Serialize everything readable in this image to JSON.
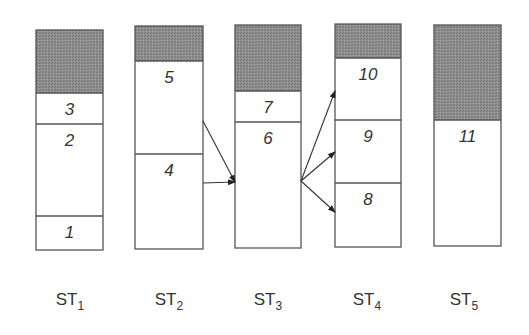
{
  "diagram": {
    "type": "segmented-stacks-with-transfer-arrows",
    "colors": {
      "shaded": "#8a8a8a",
      "outline": "#555555",
      "text": "#333333",
      "background": "#ffffff"
    },
    "stacks": [
      {
        "id": "ST1",
        "label_main": "ST",
        "label_sub": "1",
        "x": 36,
        "width": 67,
        "top": 30,
        "bottom": 250,
        "label_x": 70,
        "segments": [
          {
            "kind": "shaded",
            "top": 30,
            "bottom": 93
          },
          {
            "kind": "block",
            "label": "3",
            "top": 93,
            "bottom": 124
          },
          {
            "kind": "block",
            "label": "2",
            "top": 124,
            "bottom": 216
          },
          {
            "kind": "block",
            "label": "1",
            "top": 216,
            "bottom": 250
          }
        ]
      },
      {
        "id": "ST2",
        "label_main": "ST",
        "label_sub": "2",
        "x": 135,
        "width": 68,
        "top": 26,
        "bottom": 249,
        "label_x": 169,
        "segments": [
          {
            "kind": "shaded",
            "top": 26,
            "bottom": 61
          },
          {
            "kind": "block",
            "label": "5",
            "top": 61,
            "bottom": 154
          },
          {
            "kind": "block",
            "label": "4",
            "top": 154,
            "bottom": 249
          }
        ]
      },
      {
        "id": "ST3",
        "label_main": "ST",
        "label_sub": "3",
        "x": 235,
        "width": 66,
        "top": 25,
        "bottom": 248,
        "label_x": 268,
        "segments": [
          {
            "kind": "shaded",
            "top": 25,
            "bottom": 91
          },
          {
            "kind": "block",
            "label": "7",
            "top": 91,
            "bottom": 122
          },
          {
            "kind": "block",
            "label": "6",
            "top": 122,
            "bottom": 248
          }
        ]
      },
      {
        "id": "ST4",
        "label_main": "ST",
        "label_sub": "4",
        "x": 335,
        "width": 66,
        "top": 24,
        "bottom": 247,
        "label_x": 367,
        "segments": [
          {
            "kind": "shaded",
            "top": 24,
            "bottom": 58
          },
          {
            "kind": "block",
            "label": "10",
            "top": 58,
            "bottom": 120
          },
          {
            "kind": "block",
            "label": "9",
            "top": 120,
            "bottom": 183
          },
          {
            "kind": "block",
            "label": "8",
            "top": 183,
            "bottom": 247
          }
        ]
      },
      {
        "id": "ST5",
        "label_main": "ST",
        "label_sub": "5",
        "x": 434,
        "width": 67,
        "top": 25,
        "bottom": 246,
        "label_x": 464,
        "segments": [
          {
            "kind": "shaded",
            "top": 25,
            "bottom": 120
          },
          {
            "kind": "block",
            "label": "11",
            "top": 120,
            "bottom": 246
          }
        ]
      }
    ],
    "arrows": [
      {
        "from": "ST2 block 5",
        "to": "ST3 block 6",
        "x1": 203,
        "y1": 121,
        "x2": 235,
        "y2": 182
      },
      {
        "from": "ST2 block 4",
        "to": "ST3 block 6",
        "x1": 203,
        "y1": 183,
        "x2": 235,
        "y2": 182
      },
      {
        "from": "ST3 block 6",
        "to": "ST4 block 10",
        "x1": 301,
        "y1": 181,
        "x2": 335,
        "y2": 91
      },
      {
        "from": "ST3 block 6",
        "to": "ST4 block 9",
        "x1": 301,
        "y1": 181,
        "x2": 335,
        "y2": 152
      },
      {
        "from": "ST3 block 6",
        "to": "ST4 block 8",
        "x1": 301,
        "y1": 181,
        "x2": 335,
        "y2": 212
      }
    ],
    "label_y": 305
  }
}
